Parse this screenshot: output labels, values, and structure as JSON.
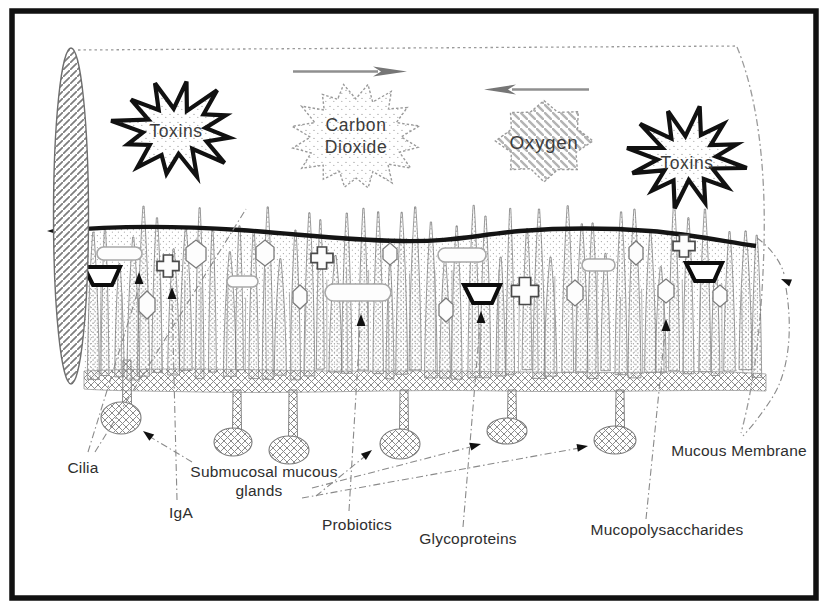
{
  "diagram": {
    "bursts": {
      "toxins_left": "Toxins",
      "carbon_line1": "Carbon",
      "carbon_line2": "Dioxide",
      "oxygen": "Oxygen",
      "toxins_right": "Toxins"
    },
    "labels": {
      "cilia": "Cilia",
      "iga": "IgA",
      "submucosal_glands_line1": "Submucosal mucous",
      "submucosal_glands_line2": "glands",
      "probiotics": "Probiotics",
      "glycoproteins": "Glycoproteins",
      "mucopolysaccharides": "Mucopolysaccharides",
      "mucous_membrane": "Mucous Membrane"
    },
    "colors": {
      "ink": "#1a1a1a",
      "gray": "#8a8a8a",
      "texture": "#9a9a9a"
    }
  }
}
